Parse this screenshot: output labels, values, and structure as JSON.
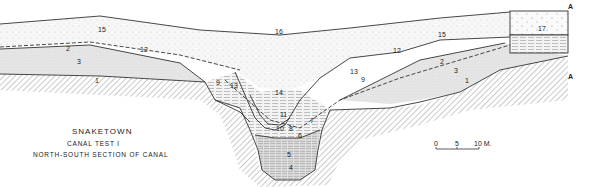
{
  "title": "SNAKETOWN",
  "subtitle1": "CANAL TEST I",
  "subtitle2": "NORTH-SOUTH SECTION OF CANAL",
  "scale": {
    "ticks": [
      "0",
      "5",
      "10 M."
    ]
  },
  "markers": {
    "top": "A",
    "bottom": "A"
  },
  "layers": {
    "l1a": "1",
    "l1b": "1",
    "l2a": "2",
    "l2b": "2",
    "l3a": "3",
    "l3b": "3",
    "l4": "4",
    "l5": "5",
    "l6": "6",
    "l7": "7",
    "l8": "8",
    "l9a": "9",
    "l9b": "9",
    "l10": "10",
    "l11": "11",
    "l12a": "12",
    "l12b": "12",
    "l13a": "13",
    "l13b": "13",
    "l14": "14",
    "l15a": "15",
    "l15b": "15",
    "l16": "16",
    "l17": "17"
  },
  "colors": {
    "ink": "#333333",
    "fill_light": "#ececec",
    "fill_mid": "#dcdcdc",
    "bg": "#ffffff"
  }
}
